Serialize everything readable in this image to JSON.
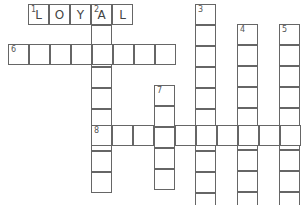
{
  "puzzle": {
    "cell_size": 21,
    "clues": [
      {
        "number": "1",
        "direction": "across",
        "x": 28,
        "y": 4,
        "length": 5,
        "letters": [
          "L",
          "O",
          "Y",
          "A",
          "L"
        ]
      },
      {
        "number": "2",
        "direction": "down",
        "x": 91,
        "y": 4,
        "length": 9,
        "letters": []
      },
      {
        "number": "3",
        "direction": "down",
        "x": 195,
        "y": 4,
        "length": 10,
        "letters": []
      },
      {
        "number": "4",
        "direction": "down",
        "x": 237,
        "y": 24,
        "length": 9,
        "letters": []
      },
      {
        "number": "5",
        "direction": "down",
        "x": 279,
        "y": 24,
        "length": 9,
        "letters": []
      },
      {
        "number": "6",
        "direction": "across",
        "x": 8,
        "y": 44,
        "length": 8,
        "letters": []
      },
      {
        "number": "7",
        "direction": "down",
        "x": 154,
        "y": 85,
        "length": 5,
        "letters": []
      },
      {
        "number": "8",
        "direction": "across",
        "x": 91,
        "y": 125,
        "length": 10,
        "letters": []
      }
    ]
  }
}
